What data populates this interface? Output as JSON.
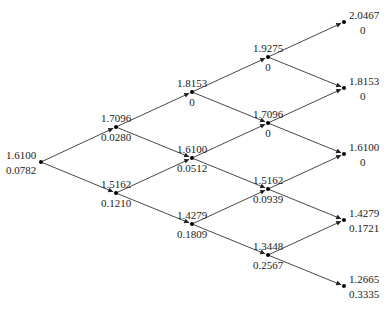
{
  "diagram": {
    "type": "binomial-tree",
    "levels": 5,
    "nodes": [
      {
        "id": "n0_0",
        "x": 41,
        "y": 162,
        "top": "1.6100",
        "bottom": "0.0782",
        "label_side": "left"
      },
      {
        "id": "n1_0",
        "x": 116,
        "y": 127,
        "top": "1.7096",
        "bottom": "0.0280",
        "label_side": "below"
      },
      {
        "id": "n1_1",
        "x": 116,
        "y": 193,
        "top": "1.5162",
        "bottom": "0.1210",
        "label_side": "below"
      },
      {
        "id": "n2_0",
        "x": 192,
        "y": 92,
        "top": "1.8153",
        "bottom": "0",
        "label_side": "below"
      },
      {
        "id": "n2_1",
        "x": 192,
        "y": 158,
        "top": "1.6100",
        "bottom": "0.0512",
        "label_side": "below"
      },
      {
        "id": "n2_2",
        "x": 192,
        "y": 224,
        "top": "1.4279",
        "bottom": "0.1809",
        "label_side": "below"
      },
      {
        "id": "n3_0",
        "x": 268,
        "y": 57,
        "top": "1.9275",
        "bottom": "0",
        "label_side": "below"
      },
      {
        "id": "n3_1",
        "x": 268,
        "y": 123,
        "top": "1.7096",
        "bottom": "0",
        "label_side": "below"
      },
      {
        "id": "n3_2",
        "x": 268,
        "y": 189,
        "top": "1.5162",
        "bottom": "0.0939",
        "label_side": "below"
      },
      {
        "id": "n3_3",
        "x": 268,
        "y": 255,
        "top": "1.3448",
        "bottom": "0.2567",
        "label_side": "below"
      },
      {
        "id": "n4_0",
        "x": 344,
        "y": 22,
        "top": "2.0467",
        "bottom": "0",
        "label_side": "right"
      },
      {
        "id": "n4_1",
        "x": 344,
        "y": 88,
        "top": "1.8153",
        "bottom": "0",
        "label_side": "right"
      },
      {
        "id": "n4_2",
        "x": 344,
        "y": 154,
        "top": "1.6100",
        "bottom": "0",
        "label_side": "right"
      },
      {
        "id": "n4_3",
        "x": 344,
        "y": 220,
        "top": "1.4279",
        "bottom": "0.1721",
        "label_side": "right"
      },
      {
        "id": "n4_4",
        "x": 344,
        "y": 286,
        "top": "1.2665",
        "bottom": "0.3335",
        "label_side": "right"
      }
    ],
    "edges": [
      [
        "n0_0",
        "n1_0"
      ],
      [
        "n0_0",
        "n1_1"
      ],
      [
        "n1_0",
        "n2_0"
      ],
      [
        "n1_0",
        "n2_1"
      ],
      [
        "n1_1",
        "n2_1"
      ],
      [
        "n1_1",
        "n2_2"
      ],
      [
        "n2_0",
        "n3_0"
      ],
      [
        "n2_0",
        "n3_1"
      ],
      [
        "n2_1",
        "n3_1"
      ],
      [
        "n2_1",
        "n3_2"
      ],
      [
        "n2_2",
        "n3_2"
      ],
      [
        "n2_2",
        "n3_3"
      ],
      [
        "n3_0",
        "n4_0"
      ],
      [
        "n3_0",
        "n4_1"
      ],
      [
        "n3_1",
        "n4_1"
      ],
      [
        "n3_1",
        "n4_2"
      ],
      [
        "n3_2",
        "n4_2"
      ],
      [
        "n3_2",
        "n4_3"
      ],
      [
        "n3_3",
        "n4_3"
      ],
      [
        "n3_3",
        "n4_4"
      ]
    ]
  }
}
